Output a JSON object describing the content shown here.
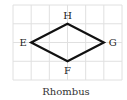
{
  "figure": {
    "caption": "Rhombus",
    "grid": {
      "columns": 6,
      "rows": 4
    },
    "shape": "rhombus",
    "vertices": [
      {
        "label": "E",
        "col": 1,
        "row": 2
      },
      {
        "label": "H",
        "col": 3,
        "row": 1
      },
      {
        "label": "G",
        "col": 5,
        "row": 2
      },
      {
        "label": "F",
        "col": 3,
        "row": 3
      }
    ],
    "colors": {
      "grid": "#e0e0e0",
      "outline": "#111111"
    }
  }
}
